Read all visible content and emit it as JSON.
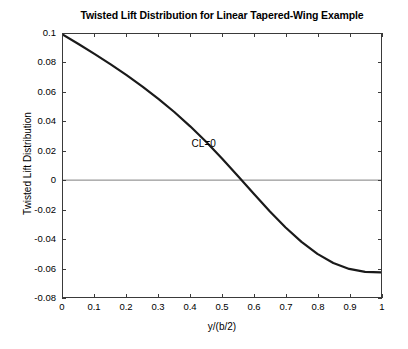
{
  "chart_data": {
    "type": "line",
    "title": "Twisted Lift Distribution for Linear Tapered-Wing Example",
    "xlabel": "y/(b/2)",
    "ylabel": "Twisted Lift Distribution",
    "xlim": [
      0,
      1
    ],
    "ylim": [
      -0.08,
      0.1
    ],
    "grid": false,
    "legend": null,
    "xticks": [
      "0",
      "0.1",
      "0.2",
      "0.3",
      "0.4",
      "0.5",
      "0.6",
      "0.7",
      "0.8",
      "0.9",
      "1"
    ],
    "xtick_values": [
      0,
      0.1,
      0.2,
      0.3,
      0.4,
      0.5,
      0.6,
      0.7,
      0.8,
      0.9,
      1
    ],
    "yticks": [
      "0.1",
      "0.08",
      "0.06",
      "0.04",
      "0.02",
      "0",
      "-0.02",
      "-0.04",
      "-0.06",
      "-0.08"
    ],
    "ytick_values": [
      0.1,
      0.08,
      0.06,
      0.04,
      0.02,
      0,
      -0.02,
      -0.04,
      -0.06,
      -0.08
    ],
    "annotations": [
      {
        "text": "CL=0",
        "x": 0.405,
        "y": 0.0245
      }
    ],
    "zero_line": {
      "y": 0,
      "color": "#7d7d7d"
    },
    "series": [
      {
        "name": "Twisted lift distribution",
        "color": "#1a1a1a",
        "linewidth": 2.2,
        "x": [
          0.0,
          0.05,
          0.1,
          0.15,
          0.2,
          0.25,
          0.3,
          0.35,
          0.4,
          0.45,
          0.5,
          0.55,
          0.6,
          0.65,
          0.7,
          0.75,
          0.8,
          0.85,
          0.9,
          0.95,
          1.0
        ],
        "values": [
          0.0995,
          0.093,
          0.0862,
          0.0792,
          0.0718,
          0.064,
          0.0556,
          0.0466,
          0.0368,
          0.0262,
          0.0148,
          0.0028,
          -0.0094,
          -0.0213,
          -0.0324,
          -0.0423,
          -0.0505,
          -0.0567,
          -0.0608,
          -0.0628,
          -0.0632
        ]
      }
    ],
    "zero_crossing": {
      "x": 0.462,
      "y": 0
    }
  },
  "figure": {
    "background_color": "#ffffff",
    "axes_color": "#3a3a3a"
  }
}
